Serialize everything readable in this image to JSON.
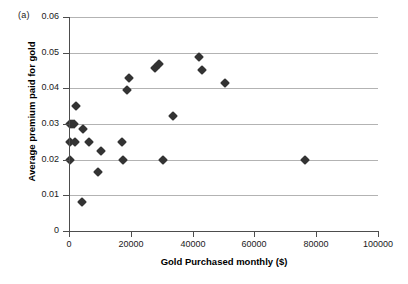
{
  "figure": {
    "panel_label": "(a)",
    "background_color": "#ffffff",
    "marker_color": "#333333",
    "grid_color": "#b3b3b3",
    "axis_color": "#4d4d4d"
  },
  "chart_data": {
    "type": "scatter",
    "title": "",
    "panel": "(a)",
    "xlabel": "Gold Purchased monthly ($)",
    "ylabel": "Average premium paid for gold",
    "xlim": [
      0,
      100000
    ],
    "ylim": [
      0,
      0.06
    ],
    "xticks": [
      0,
      20000,
      40000,
      60000,
      80000,
      100000
    ],
    "xtick_labels": [
      "0",
      "20000",
      "40000",
      "60000",
      "80000",
      "100000"
    ],
    "yticks": [
      0,
      0.01,
      0.02,
      0.03,
      0.04,
      0.05,
      0.06
    ],
    "ytick_labels": [
      "0",
      "0.01",
      "0.02",
      "0.03",
      "0.04",
      "0.05",
      "0.06"
    ],
    "grid": "horizontal",
    "legend": "none",
    "marker": "diamond",
    "points": [
      {
        "x": 300,
        "y": 0.02
      },
      {
        "x": 300,
        "y": 0.025
      },
      {
        "x": 400,
        "y": 0.03
      },
      {
        "x": 1100,
        "y": 0.03
      },
      {
        "x": 1600,
        "y": 0.03
      },
      {
        "x": 2000,
        "y": 0.025
      },
      {
        "x": 2200,
        "y": 0.035
      },
      {
        "x": 4100,
        "y": 0.008
      },
      {
        "x": 4600,
        "y": 0.0285
      },
      {
        "x": 6500,
        "y": 0.025
      },
      {
        "x": 9400,
        "y": 0.0165
      },
      {
        "x": 10200,
        "y": 0.0225
      },
      {
        "x": 17300,
        "y": 0.025
      },
      {
        "x": 17600,
        "y": 0.02
      },
      {
        "x": 18700,
        "y": 0.0395
      },
      {
        "x": 19300,
        "y": 0.0428
      },
      {
        "x": 27700,
        "y": 0.0458
      },
      {
        "x": 29100,
        "y": 0.0468
      },
      {
        "x": 30500,
        "y": 0.02
      },
      {
        "x": 33700,
        "y": 0.0322
      },
      {
        "x": 42000,
        "y": 0.0488
      },
      {
        "x": 42900,
        "y": 0.0452
      },
      {
        "x": 50500,
        "y": 0.0415
      },
      {
        "x": 76300,
        "y": 0.02
      }
    ]
  }
}
